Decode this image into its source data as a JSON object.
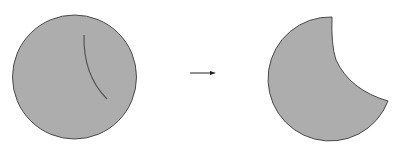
{
  "diagram": {
    "colors": {
      "fill": "#adadad",
      "stroke": "#4a4a4a",
      "cut_line": "#555555",
      "arrow": "#222222",
      "background": "#ffffff"
    },
    "before_shape": {
      "type": "circle",
      "center": [
        74.5,
        77
      ],
      "radius": 62,
      "cut_arc": {
        "start": [
          84,
          35
        ],
        "end": [
          107,
          99
        ]
      }
    },
    "arrow": {
      "from": [
        190,
        73
      ],
      "to": [
        216,
        73
      ]
    },
    "after_shape": {
      "type": "circle-with-bite",
      "center": [
        327,
        79
      ],
      "radius": 62,
      "bite_start": [
        332,
        17
      ],
      "bite_end": [
        388,
        101
      ]
    },
    "clipped_top_text": "· · · · · · · · · · · · · · · · · · · · · · · · · ·"
  }
}
